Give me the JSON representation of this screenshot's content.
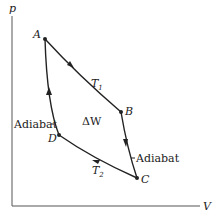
{
  "diagram": {
    "axes": {
      "y_label": "p",
      "x_label": "V"
    },
    "points": {
      "A": {
        "label": "A",
        "x": 45,
        "y": 39
      },
      "B": {
        "label": "B",
        "x": 121,
        "y": 112
      },
      "C": {
        "label": "C",
        "x": 137,
        "y": 178
      },
      "D": {
        "label": "D",
        "x": 59,
        "y": 135
      }
    },
    "curve_labels": {
      "T1": {
        "main": "T",
        "sub": "1"
      },
      "T2": {
        "main": "T",
        "sub": "2"
      },
      "adiabat_left": "Adiabat",
      "adiabat_right": "Adiabat",
      "work": "ΔW"
    },
    "colors": {
      "line": "#222222",
      "axis": "#555555"
    }
  }
}
